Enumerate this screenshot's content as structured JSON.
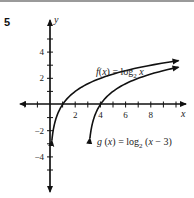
{
  "problem_number": "5",
  "chart_data": {
    "type": "line",
    "title": "",
    "xlabel": "x",
    "ylabel": "y",
    "xlim": [
      -3,
      10.5
    ],
    "ylim": [
      -6.5,
      6.8
    ],
    "x_ticks": [
      -2,
      -1,
      1,
      2,
      3,
      4,
      5,
      6,
      7,
      8,
      9,
      10
    ],
    "x_tick_labels": [
      "2",
      "4",
      "6",
      "8"
    ],
    "y_ticks": [
      -5,
      -4,
      -3,
      -2,
      -1,
      1,
      2,
      3,
      4,
      5
    ],
    "y_tick_labels": [
      "4",
      "2",
      "-2",
      "-4"
    ],
    "grid": false,
    "series": [
      {
        "name": "f(x) = log2 x",
        "label_text": "f(x) = log",
        "label_sub": "2",
        "label_tail": " x",
        "x": [
          0.125,
          0.25,
          0.5,
          1,
          2,
          4,
          8,
          10
        ],
        "y": [
          -3,
          -2,
          -1,
          0,
          1,
          2,
          3,
          3.32
        ]
      },
      {
        "name": "g(x) = log2 (x − 3)",
        "label_text": "g(x) = log",
        "label_sub": "2",
        "label_tail": " (x − 3)",
        "x": [
          3.125,
          3.25,
          3.5,
          4,
          5,
          7,
          10
        ],
        "y": [
          -3,
          -2,
          -1,
          0,
          1,
          2,
          2.81
        ]
      }
    ]
  }
}
